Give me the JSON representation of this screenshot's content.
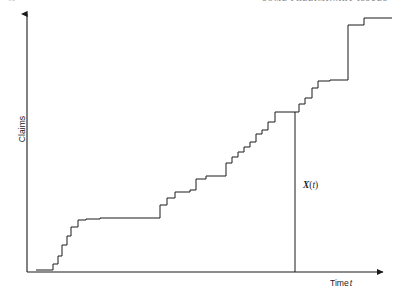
{
  "page": {
    "folio": "10",
    "running_head": "SOME PRELIMINARY ISSUES",
    "background_color": "#ffffff",
    "ink_color": "#1a1a1a"
  },
  "figure": {
    "name": "claims-counting-process",
    "y_axis_label": "Claims",
    "x_axis_label_main": "Time",
    "x_axis_label_var": "t",
    "curve_annotation": {
      "variable": "X",
      "open_paren": "(",
      "argument": "t",
      "close_paren": ")",
      "full": "X(t)"
    },
    "axes": {
      "origin_x": 27,
      "origin_y": 272,
      "y_axis_top": 12,
      "x_axis_right": 385,
      "arrow_heads": [
        "y-up",
        "x-right"
      ],
      "tick_marks": false,
      "grid": false
    },
    "marker_line": {
      "name": "evaluation-time-line",
      "x": 295,
      "y_top": 112,
      "y_bottom": 272
    }
  },
  "chart_data": {
    "type": "line",
    "subtype": "step-function",
    "title": "",
    "xlabel": "Time t",
    "ylabel": "Claims",
    "grid": false,
    "legend": null,
    "axis_ticks_labeled": false,
    "xlim": [
      0,
      100
    ],
    "ylim": [
      0,
      36
    ],
    "series": [
      {
        "name": "X(t)",
        "step_mode": "post",
        "points_px": [
          [
            36,
            270
          ],
          [
            53,
            270
          ],
          [
            53,
            264
          ],
          [
            58,
            264
          ],
          [
            58,
            256
          ],
          [
            62,
            256
          ],
          [
            62,
            245
          ],
          [
            67,
            245
          ],
          [
            67,
            236
          ],
          [
            71,
            236
          ],
          [
            71,
            227
          ],
          [
            78,
            227
          ],
          [
            78,
            220
          ],
          [
            86,
            220
          ],
          [
            86,
            219
          ],
          [
            100,
            219
          ],
          [
            100,
            218
          ],
          [
            160,
            218
          ],
          [
            160,
            205
          ],
          [
            167,
            205
          ],
          [
            167,
            198
          ],
          [
            175,
            198
          ],
          [
            175,
            192
          ],
          [
            190,
            192
          ],
          [
            190,
            190
          ],
          [
            196,
            190
          ],
          [
            196,
            179
          ],
          [
            206,
            179
          ],
          [
            206,
            176
          ],
          [
            226,
            176
          ],
          [
            226,
            163
          ],
          [
            232,
            163
          ],
          [
            232,
            157
          ],
          [
            238,
            157
          ],
          [
            238,
            152
          ],
          [
            244,
            152
          ],
          [
            244,
            147
          ],
          [
            250,
            147
          ],
          [
            250,
            142
          ],
          [
            256,
            142
          ],
          [
            256,
            134
          ],
          [
            262,
            134
          ],
          [
            262,
            130
          ],
          [
            268,
            130
          ],
          [
            268,
            122
          ],
          [
            275,
            122
          ],
          [
            275,
            112
          ],
          [
            299,
            112
          ],
          [
            299,
            104
          ],
          [
            305,
            104
          ],
          [
            305,
            98
          ],
          [
            312,
            98
          ],
          [
            312,
            88
          ],
          [
            318,
            88
          ],
          [
            318,
            81
          ],
          [
            330,
            81
          ],
          [
            330,
            80
          ],
          [
            348,
            80
          ],
          [
            348,
            25
          ],
          [
            364,
            25
          ],
          [
            364,
            18
          ],
          [
            392,
            18
          ]
        ],
        "arrival_times_x_px": [
          53,
          58,
          62,
          67,
          71,
          78,
          86,
          100,
          160,
          167,
          175,
          190,
          196,
          206,
          226,
          232,
          238,
          244,
          250,
          256,
          262,
          268,
          275,
          299,
          305,
          312,
          318,
          330,
          348,
          364
        ],
        "cumulative_count": [
          1,
          2,
          3,
          4,
          5,
          6,
          7,
          8,
          9,
          10,
          11,
          12,
          13,
          14,
          15,
          16,
          17,
          18,
          19,
          20,
          21,
          22,
          23,
          24,
          25,
          26,
          27,
          28,
          29,
          30
        ],
        "value_at_marker": 23,
        "color": "#1a1a1a",
        "line_width": 1
      }
    ]
  }
}
